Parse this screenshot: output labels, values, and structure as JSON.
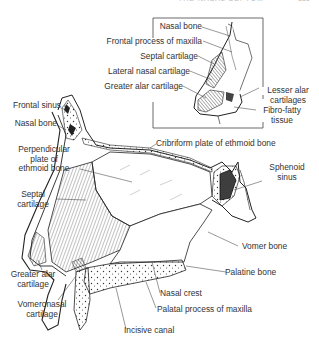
{
  "page": {
    "header_partial": "THE NASAL SEPTUM",
    "page_number_partial": "331"
  },
  "figure": {
    "inset_labels": [
      {
        "id": "nasal-bone",
        "text": "Nasal bone"
      },
      {
        "id": "frontal-process-maxilla",
        "text": "Frontal process of maxilla"
      },
      {
        "id": "septal-cartilage",
        "text": "Septal cartilage"
      },
      {
        "id": "lateral-nasal-cartilage",
        "text": "Lateral nasal cartilage"
      },
      {
        "id": "greater-alar-cartilage",
        "text": "Greater alar cartilage"
      },
      {
        "id": "lesser-alar-cartilages",
        "text": "Lesser alar cartilages"
      },
      {
        "id": "fibro-fatty-tissue",
        "text": "Fibro-fatty tissue"
      }
    ],
    "main_labels": [
      {
        "id": "frontal-sinus",
        "text": "Frontal sinus"
      },
      {
        "id": "nasal-bone",
        "text": "Nasal bone"
      },
      {
        "id": "cribriform-plate",
        "text": "Cribriform plate of ethmoid bone"
      },
      {
        "id": "perpendicular-plate",
        "text": "Perpendicular plate of ethmoid bone"
      },
      {
        "id": "sphenoid-sinus",
        "text": "Sphenoid sinus"
      },
      {
        "id": "septal-cartilage",
        "text": "Septal cartilage"
      },
      {
        "id": "vomer-bone",
        "text": "Vomer bone"
      },
      {
        "id": "palatine-bone",
        "text": "Palatine bone"
      },
      {
        "id": "greater-alar-cartilage",
        "text": "Greater alar cartilage"
      },
      {
        "id": "nasal-crest",
        "text": "Nasal crest"
      },
      {
        "id": "palatal-process-maxilla",
        "text": "Palatal process of maxilla"
      },
      {
        "id": "vomeronasal-cartilage",
        "text": "Vomeronasal cartilage"
      },
      {
        "id": "incisive-canal",
        "text": "Incisive canal"
      }
    ],
    "text": {
      "inset_nasal_bone": "Nasal bone",
      "inset_frontal_process": "Frontal process of maxilla",
      "inset_septal_cartilage": "Septal cartilage",
      "inset_lateral_nasal": "Lateral nasal cartilage",
      "inset_greater_alar": "Greater alar cartilage",
      "inset_lesser_alar_1": "Lesser alar",
      "inset_lesser_alar_2": "cartilages",
      "inset_fibro_1": "Fibro-fatty",
      "inset_fibro_2": "tissue",
      "frontal_sinus": "Frontal sinus",
      "nasal_bone": "Nasal bone",
      "cribriform": "Cribriform plate of ethmoid bone",
      "perp_1": "Perpendicular",
      "perp_2": "plate of",
      "perp_3": "ethmoid bone",
      "sphenoid_1": "Sphenoid",
      "sphenoid_2": "sinus",
      "septal_1": "Septal",
      "septal_2": "cartilage",
      "vomer": "Vomer bone",
      "palatine": "Palatine bone",
      "greater_alar_1": "Greater alar",
      "greater_alar_2": "cartilage",
      "nasal_crest": "Nasal crest",
      "palatal_process": "Palatal process of maxilla",
      "vomeronasal_1": "Vomeronasal",
      "vomeronasal_2": "cartilage",
      "incisive": "Incisive canal"
    }
  }
}
